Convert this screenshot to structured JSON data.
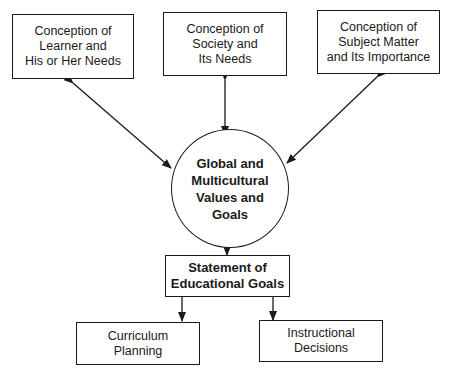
{
  "diagram": {
    "nodes": {
      "learner": {
        "label": "Conception of\nLearner and\nHis or Her Needs",
        "shape": "rectangle"
      },
      "society": {
        "label": "Conception of\nSociety and\nIts Needs",
        "shape": "rectangle"
      },
      "subject": {
        "label": "Conception of\nSubject Matter\nand Its Importance",
        "shape": "rectangle"
      },
      "global": {
        "label": "Global and\nMulticultural\nValues and\nGoals",
        "shape": "circle"
      },
      "statement": {
        "label": "Statement of\nEducational Goals",
        "shape": "rectangle"
      },
      "curriculum": {
        "label": "Curriculum\nPlanning",
        "shape": "rectangle"
      },
      "instructional": {
        "label": "Instructional\nDecisions",
        "shape": "rectangle"
      }
    },
    "edges": [
      {
        "from": "global",
        "to": "learner",
        "type": "bidirectional"
      },
      {
        "from": "global",
        "to": "society",
        "type": "bidirectional"
      },
      {
        "from": "global",
        "to": "subject",
        "type": "bidirectional"
      },
      {
        "from": "global",
        "to": "statement",
        "type": "directed"
      },
      {
        "from": "statement",
        "to": "curriculum",
        "type": "directed"
      },
      {
        "from": "statement",
        "to": "instructional",
        "type": "directed"
      }
    ]
  }
}
